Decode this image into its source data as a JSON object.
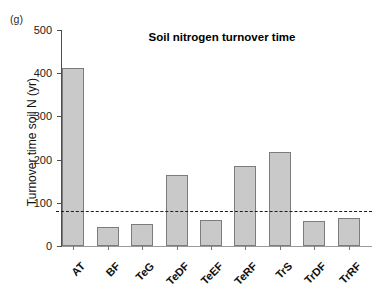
{
  "panel": {
    "label": "(g)"
  },
  "chart_data": {
    "type": "bar",
    "title": "Soil nitrogen turnover time",
    "xlabel": "",
    "ylabel": "Turnover time soil N (yr)",
    "categories": [
      "AT",
      "BF",
      "TeG",
      "TeDF",
      "TeEF",
      "TeRF",
      "TrS",
      "TrDF",
      "TrRF"
    ],
    "values": [
      412,
      44,
      51,
      164,
      60,
      185,
      218,
      58,
      65
    ],
    "ylim": [
      0,
      500
    ],
    "yticks": [
      0,
      100,
      200,
      300,
      400,
      500
    ],
    "ytick_labels": [
      "0",
      "100",
      "200",
      "300",
      "400",
      "500"
    ],
    "grid": false,
    "legend": "none",
    "bar_color": "#c9c9c9",
    "bar_edge_color": "#7c7c7c",
    "annotations": [
      {
        "name": "global-mean-reference-line",
        "type": "hline",
        "value": 80,
        "style": "dashed",
        "color": "#1c1c1c"
      }
    ]
  }
}
